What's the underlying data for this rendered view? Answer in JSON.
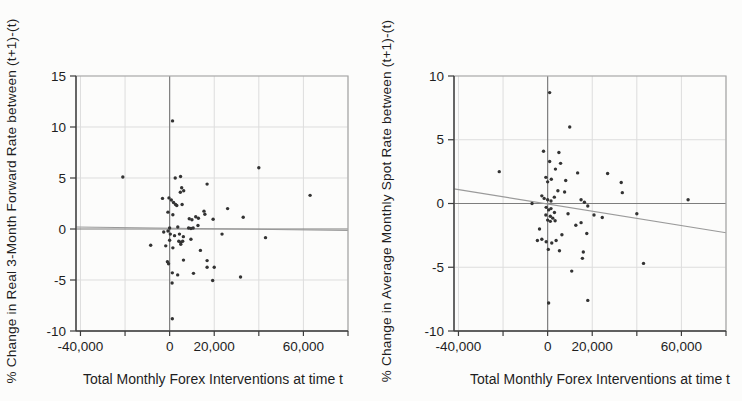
{
  "figure": {
    "description_left_ylabel": "% Change in Real 3-Month Forward Rate between (t+1)-(t)",
    "description_right_ylabel": "% Change in Average Monthly Spot Rate between (t+1)-(t)"
  },
  "colors": {
    "background": "#fcfcfb",
    "text": "#1e1e1e",
    "axis": "#3c3c3c",
    "border": "#a8a8a8",
    "grid": "#dddddd",
    "zero_line": "#7d7d7d",
    "trend_line": "#9a9a9a",
    "point": "#333333"
  },
  "chart_data": [
    {
      "type": "scatter",
      "ylabel": "% Change in Real 3-Month Forward Rate between (t+1)-(t)",
      "xlabel": "Total Monthly Forex Interventions at time t",
      "xlim": [
        -42000,
        80000
      ],
      "ylim": [
        -10,
        15
      ],
      "grid": true,
      "legend": "none",
      "x_ticks": [
        -40000,
        -20000,
        0,
        20000,
        40000,
        60000,
        80000
      ],
      "x_tick_labels": [
        {
          "value": -40000,
          "label": "-40,000"
        },
        {
          "value": 0,
          "label": "0"
        },
        {
          "value": 20000,
          "label": "20,000"
        },
        {
          "value": 60000,
          "label": "60,000"
        }
      ],
      "y_ticks": [
        {
          "value": 15,
          "label": "15"
        },
        {
          "value": 10,
          "label": "10"
        },
        {
          "value": 5,
          "label": "5"
        },
        {
          "value": 0,
          "label": "0"
        },
        {
          "value": -5,
          "label": "-5"
        },
        {
          "value": -10,
          "label": "-10"
        }
      ],
      "zero_lines": true,
      "trend_line": {
        "x1": -42000,
        "y1": 0.2,
        "x2": 80000,
        "y2": -0.15
      },
      "points": [
        [
          -21000,
          5.1
        ],
        [
          1300,
          10.6
        ],
        [
          40000,
          6.0
        ],
        [
          63000,
          3.3
        ],
        [
          2500,
          5.0
        ],
        [
          4900,
          5.15
        ],
        [
          16800,
          4.4
        ],
        [
          5400,
          4.05
        ],
        [
          6300,
          3.75
        ],
        [
          4800,
          3.6
        ],
        [
          -3200,
          3.0
        ],
        [
          -300,
          3.05
        ],
        [
          750,
          2.85
        ],
        [
          1750,
          2.6
        ],
        [
          2650,
          2.4
        ],
        [
          3200,
          2.3
        ],
        [
          5600,
          2.4
        ],
        [
          -750,
          1.65
        ],
        [
          1450,
          1.4
        ],
        [
          15400,
          1.75
        ],
        [
          15800,
          1.45
        ],
        [
          11700,
          1.2
        ],
        [
          12900,
          1.05
        ],
        [
          8800,
          1.0
        ],
        [
          10000,
          0.9
        ],
        [
          19500,
          0.95
        ],
        [
          26000,
          2.0
        ],
        [
          33000,
          1.15
        ],
        [
          3650,
          0.2
        ],
        [
          0,
          0.1
        ],
        [
          8500,
          0.1
        ],
        [
          9550,
          0.05
        ],
        [
          10550,
          0.1
        ],
        [
          12700,
          0.35
        ],
        [
          -2650,
          -0.3
        ],
        [
          -750,
          -0.2
        ],
        [
          300,
          -0.5
        ],
        [
          2200,
          -0.65
        ],
        [
          4400,
          -0.5
        ],
        [
          6150,
          -0.75
        ],
        [
          23500,
          -0.5
        ],
        [
          0,
          -1.1
        ],
        [
          4100,
          -1.2
        ],
        [
          5000,
          -1.3
        ],
        [
          5850,
          -1.2
        ],
        [
          5000,
          -1.5
        ],
        [
          9550,
          -1.0
        ],
        [
          -1750,
          -1.65
        ],
        [
          1450,
          -1.85
        ],
        [
          -8500,
          -1.6
        ],
        [
          13800,
          -2.1
        ],
        [
          6200,
          -3.05
        ],
        [
          -1000,
          -3.2
        ],
        [
          -500,
          -3.4
        ],
        [
          16800,
          -3.1
        ],
        [
          16800,
          -3.75
        ],
        [
          20000,
          -3.75
        ],
        [
          1200,
          -4.3
        ],
        [
          3600,
          -4.5
        ],
        [
          10700,
          -4.35
        ],
        [
          19300,
          -5.05
        ],
        [
          31800,
          -4.7
        ],
        [
          1100,
          -5.3
        ],
        [
          43000,
          -0.85
        ],
        [
          1200,
          -8.8
        ]
      ]
    },
    {
      "type": "scatter",
      "ylabel": "% Change in Average Monthly Spot Rate between (t+1)-(t)",
      "xlabel": "Total Monthly Forex Interventions at time t",
      "xlim": [
        -42000,
        80000
      ],
      "ylim": [
        -10,
        10
      ],
      "grid": true,
      "legend": "none",
      "x_ticks": [
        -40000,
        -20000,
        0,
        20000,
        40000,
        60000,
        80000
      ],
      "x_tick_labels": [
        {
          "value": -40000,
          "label": "-40,000"
        },
        {
          "value": 0,
          "label": "0"
        },
        {
          "value": 20000,
          "label": "20,000"
        },
        {
          "value": 60000,
          "label": "60,000"
        }
      ],
      "y_ticks": [
        {
          "value": 10,
          "label": "10"
        },
        {
          "value": 5,
          "label": "5"
        },
        {
          "value": 0,
          "label": "0"
        },
        {
          "value": -5,
          "label": "-5"
        },
        {
          "value": -10,
          "label": "-10"
        }
      ],
      "zero_lines": true,
      "trend_line": {
        "x1": -42000,
        "y1": 1.15,
        "x2": 80000,
        "y2": -2.3
      },
      "points": [
        [
          900,
          8.7
        ],
        [
          9900,
          6.0
        ],
        [
          -21700,
          2.5
        ],
        [
          -1850,
          4.1
        ],
        [
          5050,
          4.0
        ],
        [
          900,
          3.3
        ],
        [
          5800,
          3.15
        ],
        [
          3500,
          2.7
        ],
        [
          -800,
          2.05
        ],
        [
          0,
          1.7
        ],
        [
          1650,
          1.9
        ],
        [
          8100,
          1.8
        ],
        [
          13450,
          2.4
        ],
        [
          26900,
          2.35
        ],
        [
          33000,
          1.65
        ],
        [
          33500,
          0.85
        ],
        [
          7600,
          0.9
        ],
        [
          4600,
          1.0
        ],
        [
          -2600,
          0.6
        ],
        [
          -1550,
          0.4
        ],
        [
          0,
          0.3
        ],
        [
          1500,
          0.2
        ],
        [
          3000,
          0.5
        ],
        [
          -7000,
          0.0
        ],
        [
          15000,
          0.3
        ],
        [
          16500,
          0.1
        ],
        [
          18000,
          -0.2
        ],
        [
          20800,
          -0.9
        ],
        [
          24500,
          -1.1
        ],
        [
          -650,
          -0.3
        ],
        [
          450,
          -0.5
        ],
        [
          1500,
          -0.4
        ],
        [
          3050,
          -0.7
        ],
        [
          -800,
          -0.9
        ],
        [
          1200,
          -1.0
        ],
        [
          2300,
          -1.15
        ],
        [
          0,
          -1.3
        ],
        [
          1200,
          -1.4
        ],
        [
          3350,
          -1.35
        ],
        [
          9150,
          -0.8
        ],
        [
          12650,
          -1.7
        ],
        [
          15000,
          -1.5
        ],
        [
          17550,
          -2.35
        ],
        [
          6400,
          -2.45
        ],
        [
          -3650,
          -2.0
        ],
        [
          -2600,
          -2.8
        ],
        [
          -650,
          -3.0
        ],
        [
          -4600,
          -2.9
        ],
        [
          1850,
          -3.1
        ],
        [
          3800,
          -2.9
        ],
        [
          300,
          -3.6
        ],
        [
          5300,
          -3.7
        ],
        [
          16000,
          -3.8
        ],
        [
          15600,
          -4.3
        ],
        [
          10800,
          -5.3
        ],
        [
          450,
          -7.8
        ],
        [
          18000,
          -7.6
        ],
        [
          43000,
          -4.7
        ],
        [
          40000,
          -0.8
        ],
        [
          63000,
          0.3
        ]
      ]
    }
  ]
}
